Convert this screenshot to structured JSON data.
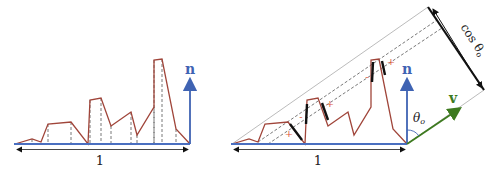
{
  "colors": {
    "profile": "#a0453a",
    "normal": "#3f63b3",
    "view": "#3d7a1f",
    "baseline": "#4a6fc0",
    "guide": "#555555",
    "projection": "#111111",
    "sign": "#e0553c",
    "triangle": "#aaaaaa"
  },
  "left_panel": {
    "normal_label": "n",
    "width_label": "1"
  },
  "right_panel": {
    "normal_label": "n",
    "view_label": "v",
    "angle_label": "θ",
    "angle_subscript": "o",
    "width_label": "1",
    "projected_label": "cos θ",
    "projected_subscript": "o",
    "signs": [
      "+",
      "-",
      "+",
      "-",
      "+",
      "-",
      "+"
    ]
  }
}
